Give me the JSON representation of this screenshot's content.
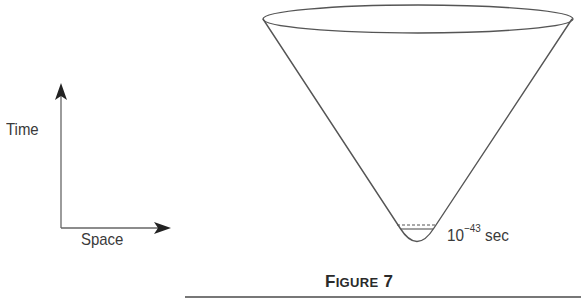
{
  "figure": {
    "caption_first": "F",
    "caption_smallcaps": "IGURE",
    "caption_number": "7",
    "axes": {
      "y_label": "Time",
      "x_label": "Space"
    },
    "cone": {
      "annotation_base": "10",
      "annotation_exponent": "−43",
      "annotation_unit": "sec"
    },
    "colors": {
      "line": "#555555",
      "text": "#3a3a3a",
      "rule": "#777777"
    }
  }
}
